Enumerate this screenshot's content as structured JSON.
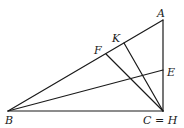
{
  "diagram": {
    "type": "geometry-triangle",
    "points": {
      "A": {
        "x": 163,
        "y": 20
      },
      "B": {
        "x": 8,
        "y": 111
      },
      "C": {
        "x": 163,
        "y": 111
      },
      "E": {
        "x": 163,
        "y": 70
      },
      "F": {
        "x": 106,
        "y": 54
      },
      "K": {
        "x": 124,
        "y": 43
      }
    },
    "segments": [
      [
        "A",
        "B"
      ],
      [
        "B",
        "C"
      ],
      [
        "C",
        "A"
      ],
      [
        "B",
        "E"
      ],
      [
        "C",
        "F"
      ],
      [
        "C",
        "K"
      ]
    ],
    "labels": {
      "A": "A",
      "B": "B",
      "CH": "C = H",
      "E": "E",
      "F": "F",
      "K": "K"
    }
  }
}
